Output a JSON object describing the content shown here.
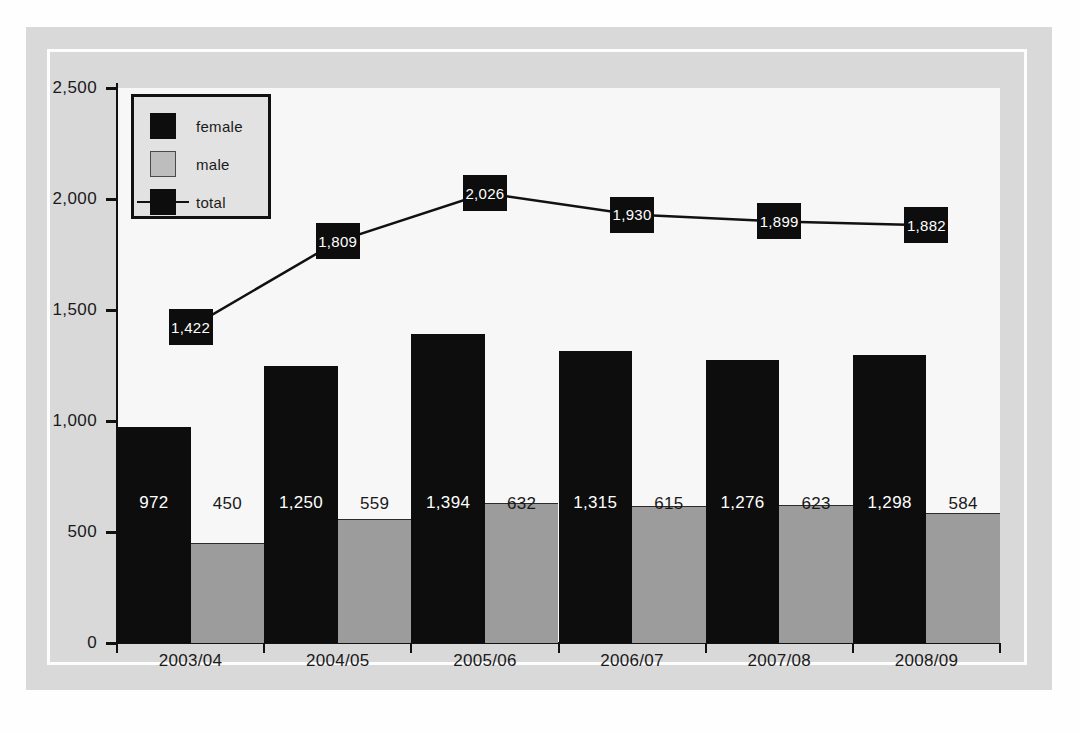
{
  "chart_data": {
    "type": "bar",
    "title": "",
    "subtitle": "",
    "xlabel": "",
    "ylabel": "",
    "categories": [
      "2003/04",
      "2004/05",
      "2005/06",
      "2006/07",
      "2007/08",
      "2008/09"
    ],
    "ylim": [
      0,
      2500
    ],
    "ytick_labels": [
      "2,500",
      "2,000",
      "1,500",
      "1,000",
      "500",
      "0"
    ],
    "ytick_values": [
      2500,
      2000,
      1500,
      1000,
      500,
      0
    ],
    "grid": false,
    "legend_position": "top-left",
    "series": [
      {
        "name": "female",
        "type": "bar",
        "color": "#0d0d0d",
        "values": [
          972,
          1250,
          1394,
          1315,
          1276,
          1298
        ],
        "labels": [
          "972",
          "1,250",
          "1,394",
          "1,315",
          "1,276",
          "1,298"
        ]
      },
      {
        "name": "male",
        "type": "bar",
        "color": "#9c9c9c",
        "values": [
          450,
          559,
          632,
          615,
          623,
          584
        ],
        "labels": [
          "450",
          "559",
          "632",
          "615",
          "623",
          "584"
        ]
      },
      {
        "name": "total",
        "type": "line",
        "color": "#0d0d0d",
        "values": [
          1422,
          1809,
          2026,
          1930,
          1899,
          1882
        ],
        "labels": [
          "1,422",
          "1,809",
          "2,026",
          "1,930",
          "1,899",
          "1,882"
        ]
      }
    ]
  },
  "legend": {
    "items": [
      {
        "label": "female",
        "swatch": "female"
      },
      {
        "label": "male",
        "swatch": "male"
      },
      {
        "label": "total",
        "swatch": "total"
      }
    ]
  },
  "colors": {
    "female": "#0d0d0d",
    "male": "#9c9c9c",
    "total": "#0d0d0d",
    "panel": "#d9d9d9",
    "plot_background": "#f7f7f7",
    "axis": "#111111"
  }
}
